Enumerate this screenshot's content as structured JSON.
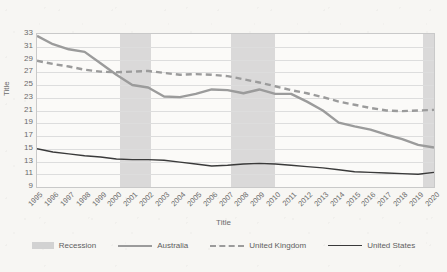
{
  "chart_data": {
    "type": "line",
    "title": "",
    "xlabel": "Title",
    "ylabel": "Title",
    "x": [
      1995,
      1996,
      1997,
      1998,
      1999,
      2000,
      2001,
      2002,
      2003,
      2004,
      2005,
      2006,
      2007,
      2008,
      2009,
      2010,
      2011,
      2012,
      2013,
      2014,
      2015,
      2016,
      2017,
      2018,
      2019,
      2020
    ],
    "xlim": [
      1995,
      2020
    ],
    "ylim": [
      9,
      33
    ],
    "yticks": [
      9,
      11,
      13,
      15,
      17,
      19,
      21,
      23,
      25,
      27,
      29,
      31,
      33
    ],
    "xticks": [
      "1995",
      "1996",
      "1997",
      "1998",
      "1999",
      "2000",
      "2001",
      "2002",
      "2003",
      "2004",
      "2005",
      "2006",
      "2007",
      "2008",
      "2009",
      "2010",
      "2011",
      "2012",
      "2013",
      "2014",
      "2015",
      "2016",
      "2017",
      "2018",
      "2019",
      "2020"
    ],
    "grid": "horizontal",
    "legend_position": "bottom",
    "series": [
      {
        "name": "Australia",
        "style": "solid",
        "color": "#9b9b9b",
        "width": 2.4,
        "values": [
          32.7,
          31.4,
          30.6,
          30.2,
          28.4,
          26.6,
          25.0,
          24.6,
          23.2,
          23.1,
          23.6,
          24.3,
          24.2,
          23.7,
          24.3,
          23.6,
          23.6,
          22.4,
          21.0,
          19.1,
          18.5,
          18.0,
          17.2,
          16.5,
          15.6,
          15.2
        ]
      },
      {
        "name": "United Kingdom",
        "style": "dashed",
        "color": "#9b9b9b",
        "width": 2.4,
        "values": [
          28.8,
          28.3,
          27.9,
          27.4,
          27.1,
          27.0,
          27.1,
          27.2,
          26.9,
          26.6,
          26.7,
          26.6,
          26.4,
          25.9,
          25.4,
          24.8,
          24.2,
          23.7,
          23.1,
          22.4,
          21.9,
          21.4,
          21.0,
          20.9,
          21.0,
          21.1
        ]
      },
      {
        "name": "United States",
        "style": "solid",
        "color": "#3a3a3a",
        "width": 1.4,
        "values": [
          15.0,
          14.5,
          14.2,
          13.9,
          13.7,
          13.4,
          13.3,
          13.3,
          13.2,
          12.9,
          12.6,
          12.3,
          12.4,
          12.6,
          12.7,
          12.6,
          12.4,
          12.2,
          12.0,
          11.7,
          11.4,
          11.3,
          11.2,
          11.1,
          11.0,
          11.3
        ]
      }
    ],
    "recession_bands": [
      {
        "label": "Recession",
        "start": 2000.2,
        "end": 2002.2
      },
      {
        "label": "Recession",
        "start": 2007.2,
        "end": 2010.0
      },
      {
        "label": "Recession",
        "start": 2019.3,
        "end": 2020.0
      }
    ],
    "legend": [
      {
        "label": "Recession",
        "marker": "band"
      },
      {
        "label": "Australia",
        "marker": "solid-thick"
      },
      {
        "label": "United Kingdom",
        "marker": "dashed"
      },
      {
        "label": "United States",
        "marker": "solid-thin"
      }
    ],
    "colors": {
      "recession_band": "#d2d2d2",
      "australia": "#9b9b9b",
      "united_kingdom": "#9b9b9b",
      "united_states": "#3a3a3a",
      "gridline": "#dddddd",
      "plot_border": "#c9c9c9",
      "background": "#f7f6f3"
    }
  }
}
